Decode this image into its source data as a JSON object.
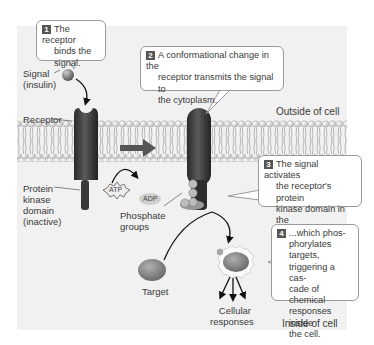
{
  "diagram": {
    "regions": {
      "outside": "Outside of cell",
      "inside": "Inside of cell"
    },
    "labels": {
      "signal_line1": "Signal",
      "signal_line2": "(insulin)",
      "receptor": "Receptor",
      "kinase_line1": "Protein",
      "kinase_line2": "kinase",
      "kinase_line3": "domain",
      "kinase_line4": "(inactive)",
      "atp": "ATP",
      "adp": "ADP",
      "phosphate_line1": "Phosphate",
      "phosphate_line2": "groups",
      "phosphate_symbol": "P",
      "target": "Target",
      "responses_line1": "Cellular",
      "responses_line2": "responses"
    },
    "steps": [
      {
        "number": "1",
        "text_lines": [
          "The receptor",
          "binds the",
          "signal."
        ]
      },
      {
        "number": "2",
        "text_lines": [
          "A conformational change in the",
          "receptor transmits the signal to",
          "the cytoplasm."
        ]
      },
      {
        "number": "3",
        "text_lines": [
          "The signal activates",
          "the receptor's protein",
          "kinase domain in the",
          "cytoplasm..."
        ]
      },
      {
        "number": "4",
        "text_lines": [
          "...which phos-",
          "phorylates targets,",
          "triggering a cas-",
          "cade of chemical",
          "responses inside",
          "the cell."
        ]
      }
    ],
    "colors": {
      "panel_bg": "#f1f1f1",
      "receptor": "#3a3a3a",
      "membrane_head": "#d8d8d8",
      "target": "#8a8a8a",
      "bubble_border": "#9a9a9a"
    }
  }
}
